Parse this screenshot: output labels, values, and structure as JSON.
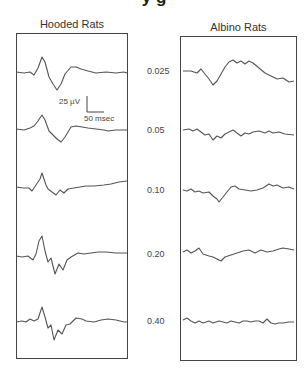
{
  "figure": {
    "top_title_partial": "y  g",
    "scale_bar": {
      "voltage_label": "25 µV",
      "time_label": "50 msec"
    }
  },
  "chart_data": {
    "type": "line",
    "title": "",
    "panels": [
      {
        "title": "Hooded Rats"
      },
      {
        "title": "Albino Rats"
      }
    ],
    "conditions": [
      "0.025",
      "0.05",
      "0.10",
      "0.20",
      "0.40"
    ],
    "xlabel": "Time (msec)",
    "ylabel": "Amplitude (µV)",
    "scale": {
      "voltage_uv": 25,
      "time_msec": 50
    },
    "grid": false,
    "series": [
      {
        "panel": "Hooded Rats",
        "condition": "0.025",
        "points": [
          [
            0,
            0
          ],
          [
            8,
            -1
          ],
          [
            14,
            0
          ],
          [
            18,
            -3
          ],
          [
            22,
            4
          ],
          [
            26,
            15
          ],
          [
            29,
            10
          ],
          [
            33,
            -5
          ],
          [
            37,
            -12
          ],
          [
            41,
            -18
          ],
          [
            45,
            -12
          ],
          [
            49,
            -2
          ],
          [
            55,
            5
          ],
          [
            60,
            5
          ],
          [
            65,
            3
          ],
          [
            72,
            1
          ],
          [
            80,
            -1
          ],
          [
            90,
            0
          ],
          [
            100,
            -1
          ],
          [
            108,
            0
          ],
          [
            111,
            -1
          ]
        ]
      },
      {
        "panel": "Hooded Rats",
        "condition": "0.05",
        "points": [
          [
            0,
            0
          ],
          [
            8,
            -1
          ],
          [
            14,
            1
          ],
          [
            18,
            3
          ],
          [
            22,
            8
          ],
          [
            26,
            14
          ],
          [
            29,
            9
          ],
          [
            33,
            -2
          ],
          [
            37,
            -6
          ],
          [
            41,
            -10
          ],
          [
            45,
            -13
          ],
          [
            49,
            -8
          ],
          [
            55,
            2
          ],
          [
            60,
            3
          ],
          [
            66,
            2
          ],
          [
            72,
            1
          ],
          [
            80,
            0
          ],
          [
            88,
            -1
          ],
          [
            92,
            -2
          ],
          [
            100,
            -1
          ],
          [
            111,
            -1
          ]
        ]
      },
      {
        "panel": "Hooded Rats",
        "condition": "0.10",
        "points": [
          [
            0,
            0
          ],
          [
            8,
            -1
          ],
          [
            13,
            -1
          ],
          [
            16,
            -4
          ],
          [
            20,
            2
          ],
          [
            24,
            8
          ],
          [
            26,
            14
          ],
          [
            28,
            8
          ],
          [
            30,
            2
          ],
          [
            32,
            -2
          ],
          [
            36,
            -5
          ],
          [
            40,
            -8
          ],
          [
            44,
            -3
          ],
          [
            48,
            -6
          ],
          [
            52,
            -2
          ],
          [
            58,
            -1
          ],
          [
            64,
            0
          ],
          [
            70,
            1
          ],
          [
            78,
            1
          ],
          [
            88,
            2
          ],
          [
            95,
            3
          ],
          [
            103,
            5
          ],
          [
            111,
            6
          ]
        ]
      },
      {
        "panel": "Hooded Rats",
        "condition": "0.20",
        "points": [
          [
            0,
            0
          ],
          [
            6,
            -1
          ],
          [
            12,
            0
          ],
          [
            17,
            -4
          ],
          [
            20,
            2
          ],
          [
            23,
            15
          ],
          [
            26,
            20
          ],
          [
            29,
            5
          ],
          [
            32,
            -6
          ],
          [
            35,
            -2
          ],
          [
            39,
            -18
          ],
          [
            43,
            -8
          ],
          [
            47,
            -14
          ],
          [
            51,
            -4
          ],
          [
            55,
            -1
          ],
          [
            62,
            3
          ],
          [
            68,
            2
          ],
          [
            75,
            3
          ],
          [
            82,
            4
          ],
          [
            90,
            4
          ],
          [
            100,
            3
          ],
          [
            111,
            3
          ]
        ]
      },
      {
        "panel": "Hooded Rats",
        "condition": "0.40",
        "points": [
          [
            0,
            0
          ],
          [
            6,
            1
          ],
          [
            10,
            0
          ],
          [
            14,
            3
          ],
          [
            18,
            1
          ],
          [
            22,
            3
          ],
          [
            26,
            15
          ],
          [
            29,
            5
          ],
          [
            32,
            -6
          ],
          [
            35,
            -3
          ],
          [
            38,
            -18
          ],
          [
            42,
            -8
          ],
          [
            46,
            -12
          ],
          [
            50,
            -3
          ],
          [
            54,
            -2
          ],
          [
            60,
            4
          ],
          [
            66,
            3
          ],
          [
            70,
            1
          ],
          [
            78,
            0
          ],
          [
            85,
            2
          ],
          [
            92,
            3
          ],
          [
            100,
            2
          ],
          [
            108,
            0
          ],
          [
            111,
            0
          ]
        ]
      },
      {
        "panel": "Albino Rats",
        "condition": "0.025",
        "points": [
          [
            0,
            0
          ],
          [
            8,
            0
          ],
          [
            14,
            -2
          ],
          [
            18,
            2
          ],
          [
            22,
            -3
          ],
          [
            26,
            -8
          ],
          [
            30,
            -14
          ],
          [
            34,
            -10
          ],
          [
            38,
            -3
          ],
          [
            42,
            4
          ],
          [
            46,
            9
          ],
          [
            50,
            11
          ],
          [
            54,
            8
          ],
          [
            58,
            10
          ],
          [
            62,
            7
          ],
          [
            66,
            10
          ],
          [
            70,
            8
          ],
          [
            76,
            3
          ],
          [
            82,
            -2
          ],
          [
            88,
            -5
          ],
          [
            94,
            -8
          ],
          [
            100,
            -7
          ],
          [
            106,
            -11
          ],
          [
            111,
            -10
          ]
        ]
      },
      {
        "panel": "Albino Rats",
        "condition": "0.05",
        "points": [
          [
            0,
            0
          ],
          [
            6,
            1
          ],
          [
            10,
            -1
          ],
          [
            14,
            1
          ],
          [
            18,
            -2
          ],
          [
            22,
            -5
          ],
          [
            26,
            -4
          ],
          [
            30,
            -10
          ],
          [
            34,
            -6
          ],
          [
            38,
            -8
          ],
          [
            42,
            -4
          ],
          [
            46,
            -2
          ],
          [
            50,
            0
          ],
          [
            54,
            -3
          ],
          [
            58,
            -6
          ],
          [
            62,
            -3
          ],
          [
            66,
            -4
          ],
          [
            70,
            -2
          ],
          [
            76,
            -1
          ],
          [
            82,
            -3
          ],
          [
            86,
            -1
          ],
          [
            90,
            -3
          ],
          [
            96,
            -2
          ],
          [
            102,
            -4
          ],
          [
            111,
            -5
          ]
        ]
      },
      {
        "panel": "Albino Rats",
        "condition": "0.10",
        "points": [
          [
            0,
            0
          ],
          [
            4,
            -1
          ],
          [
            8,
            1
          ],
          [
            12,
            -2
          ],
          [
            16,
            -1
          ],
          [
            20,
            -3
          ],
          [
            26,
            -2
          ],
          [
            30,
            -6
          ],
          [
            34,
            -9
          ],
          [
            36,
            -12
          ],
          [
            40,
            -7
          ],
          [
            44,
            -2
          ],
          [
            48,
            3
          ],
          [
            52,
            4
          ],
          [
            56,
            1
          ],
          [
            62,
            0
          ],
          [
            68,
            -1
          ],
          [
            74,
            0
          ],
          [
            80,
            2
          ],
          [
            86,
            6
          ],
          [
            90,
            4
          ],
          [
            94,
            5
          ],
          [
            100,
            2
          ],
          [
            106,
            3
          ],
          [
            111,
            1
          ]
        ]
      },
      {
        "panel": "Albino Rats",
        "condition": "0.20",
        "points": [
          [
            0,
            0
          ],
          [
            4,
            2
          ],
          [
            8,
            -1
          ],
          [
            12,
            1
          ],
          [
            16,
            4
          ],
          [
            20,
            -2
          ],
          [
            26,
            -4
          ],
          [
            30,
            -5
          ],
          [
            34,
            -7
          ],
          [
            38,
            -9
          ],
          [
            42,
            -5
          ],
          [
            48,
            -3
          ],
          [
            54,
            -1
          ],
          [
            60,
            1
          ],
          [
            66,
            2
          ],
          [
            72,
            -1
          ],
          [
            78,
            2
          ],
          [
            84,
            0
          ],
          [
            90,
            1
          ],
          [
            96,
            3
          ],
          [
            100,
            4
          ],
          [
            106,
            3
          ],
          [
            111,
            2
          ]
        ]
      },
      {
        "panel": "Albino Rats",
        "condition": "0.40",
        "points": [
          [
            0,
            0
          ],
          [
            4,
            2
          ],
          [
            8,
            -1
          ],
          [
            12,
            -3
          ],
          [
            16,
            -1
          ],
          [
            20,
            -3
          ],
          [
            26,
            -1
          ],
          [
            30,
            -3
          ],
          [
            36,
            -1
          ],
          [
            40,
            -2
          ],
          [
            44,
            -3
          ],
          [
            48,
            -1
          ],
          [
            52,
            -2
          ],
          [
            56,
            -3
          ],
          [
            60,
            -1
          ],
          [
            64,
            -1
          ],
          [
            68,
            -2
          ],
          [
            72,
            -1
          ],
          [
            76,
            -1
          ],
          [
            80,
            -3
          ],
          [
            84,
            1
          ],
          [
            88,
            -3
          ],
          [
            92,
            -4
          ],
          [
            96,
            -3
          ],
          [
            100,
            -3
          ],
          [
            106,
            -2
          ],
          [
            111,
            -2
          ]
        ]
      }
    ]
  }
}
